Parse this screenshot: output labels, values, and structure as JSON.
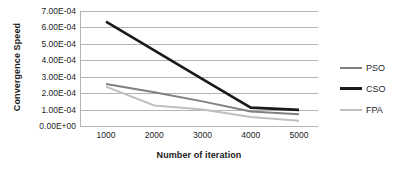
{
  "chart_data": {
    "type": "line",
    "title": "",
    "xlabel": "Number of iteration",
    "ylabel": "Convergence Speed",
    "x": [
      1000,
      2000,
      3000,
      4000,
      5000
    ],
    "x_tick_labels": [
      "1000",
      "2000",
      "3000",
      "4000",
      "5000"
    ],
    "y_tick_labels": [
      "0.00E+00",
      "1.00E-04",
      "2.00E-04",
      "3.00E-04",
      "4.00E-04",
      "5.00E-04",
      "6.00E-04",
      "7.00E-04"
    ],
    "y_tick_values": [
      0.0,
      0.0001,
      0.0002,
      0.0003,
      0.0004,
      0.0005,
      0.0006,
      0.0007
    ],
    "ylim": [
      0.0,
      0.0007
    ],
    "xlim": [
      1000,
      5000
    ],
    "grid": true,
    "grid_axis": "y",
    "legend_position": "right",
    "series": [
      {
        "name": "PSO",
        "color": "#808080",
        "linewidth": 2.0,
        "values": [
          0.000255,
          0.000205,
          0.00015,
          8.8e-05,
          7.2e-05
        ]
      },
      {
        "name": "CSO",
        "color": "#1a1a1a",
        "linewidth": 2.6,
        "values": [
          0.000635,
          0.00046,
          0.000285,
          0.000112,
          9.8e-05
        ]
      },
      {
        "name": "FPA",
        "color": "#bfbfbf",
        "linewidth": 2.0,
        "values": [
          0.00024,
          0.000125,
          0.0001,
          5.5e-05,
          3.2e-05
        ]
      }
    ]
  },
  "legend": {
    "items": [
      {
        "label": "PSO"
      },
      {
        "label": "CSO"
      },
      {
        "label": "FPA"
      }
    ]
  },
  "colors": {
    "gridline": "#b4b4b4",
    "background": "#ffffff",
    "text": "#242424"
  }
}
